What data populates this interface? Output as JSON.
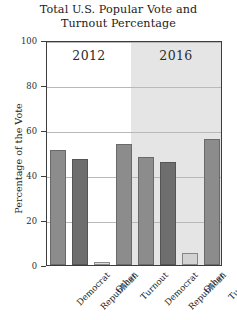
{
  "chart_data": {
    "type": "bar",
    "title": "Total U.S. Popular Vote and Turnout Percentage",
    "title_lines": [
      "Total U.S. Popular Vote and",
      "Turnout Percentage"
    ],
    "xlabel": "",
    "ylabel": "Percentage of the Vote",
    "ylim": [
      0,
      100
    ],
    "yticks": [
      0,
      20,
      40,
      60,
      80,
      100
    ],
    "ytick_labels": [
      "0",
      "20",
      "40",
      "60",
      "80",
      "100"
    ],
    "grid": true,
    "legend": "none",
    "facet_layout": "columns",
    "categories": [
      "Democrat",
      "Republican",
      "Other",
      "Turnout"
    ],
    "facets": [
      {
        "label": "2012",
        "background": "#ffffff",
        "values": [
          51,
          47,
          1.5,
          54
        ],
        "bars": [
          {
            "category": "Democrat",
            "value": 51,
            "fill": "#8c8c8c"
          },
          {
            "category": "Republican",
            "value": 47,
            "fill": "#6e6e6e"
          },
          {
            "category": "Other",
            "value": 1.5,
            "fill": "#dcdcdc"
          },
          {
            "category": "Turnout",
            "value": 54,
            "fill": "#8c8c8c"
          }
        ]
      },
      {
        "label": "2016",
        "background": "#e5e5e5",
        "values": [
          48,
          46,
          5.5,
          56
        ],
        "bars": [
          {
            "category": "Democrat",
            "value": 48,
            "fill": "#8c8c8c"
          },
          {
            "category": "Republican",
            "value": 46,
            "fill": "#6e6e6e"
          },
          {
            "category": "Other",
            "value": 5.5,
            "fill": "#d2d2d2"
          },
          {
            "category": "Turnout",
            "value": 56,
            "fill": "#8c8c8c"
          }
        ]
      }
    ]
  },
  "colors": {
    "frame": "#3d3d3d",
    "gridline": "#b9b9b9",
    "bar_mid": "#8c8c8c",
    "bar_dark": "#6e6e6e",
    "bar_light": "#dcdcdc",
    "facet_2016_bg": "#e5e5e5",
    "text": "#1c1c1c"
  }
}
